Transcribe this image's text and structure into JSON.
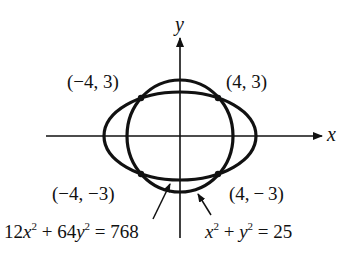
{
  "diagram": {
    "axes": {
      "x_label": "x",
      "y_label": "y"
    },
    "points": [
      {
        "label": "(−4,  3)",
        "x": -4,
        "y": 3
      },
      {
        "label": "(4, 3)",
        "x": 4,
        "y": 3
      },
      {
        "label": "(−4, −3)",
        "x": -4,
        "y": -3
      },
      {
        "label": "(4, − 3)",
        "x": 4,
        "y": -3
      }
    ],
    "curves": [
      {
        "name": "ellipse",
        "equation_parts": {
          "a": "12",
          "x": "x",
          "p1": "2",
          "plus": " + 64",
          "y": "y",
          "p2": "2",
          "rhs": " = 768"
        }
      },
      {
        "name": "circle",
        "equation_parts": {
          "x": "x",
          "p1": "2",
          "plus": " + ",
          "y": "y",
          "p2": "2",
          "rhs": " = 25"
        }
      }
    ],
    "colors": {
      "ink": "#111111",
      "background": "#ffffff"
    }
  }
}
